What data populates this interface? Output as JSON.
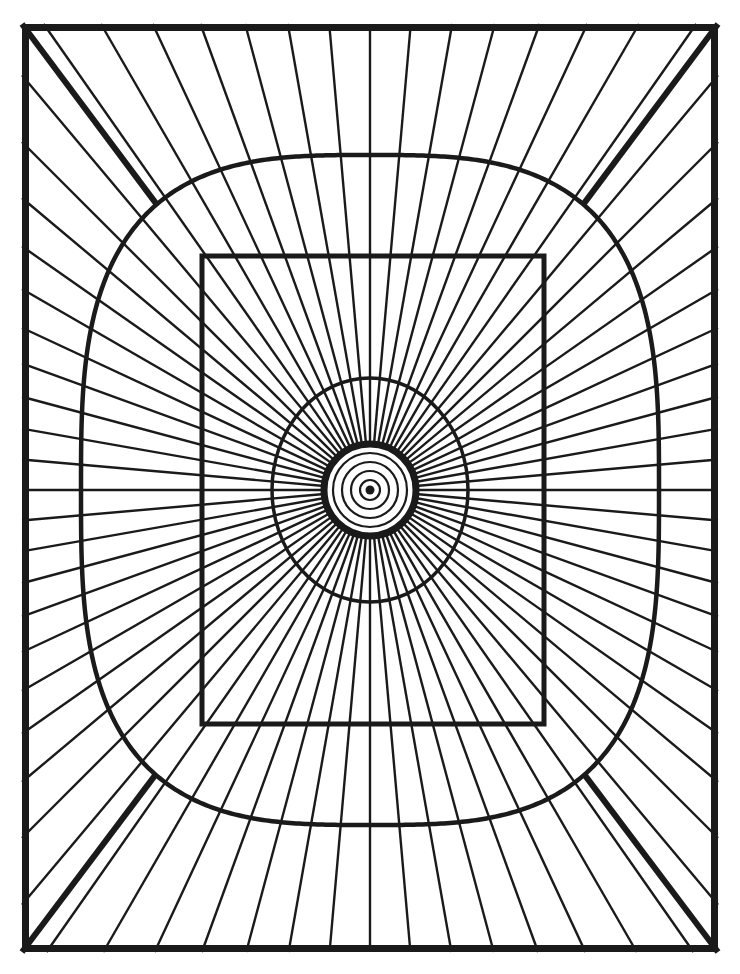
{
  "document": {
    "kind": "line-art-coloring-page",
    "title": "Radial Sunburst Mandala",
    "canvas": {
      "width": 740,
      "height": 974,
      "background": "#ffffff"
    },
    "ink_color": "#1a1a1a"
  },
  "geometry": {
    "center": {
      "x": 370,
      "y": 490
    },
    "outer_frame": {
      "name": "outer-rectangle-frame",
      "x": 22,
      "y": 24,
      "width": 696,
      "height": 928,
      "stroke_width": 7
    },
    "corner_diagonals": {
      "name": "corner-diagonal-rays",
      "count": 4,
      "stroke_width": 6,
      "from_corners": [
        {
          "x": 22,
          "y": 24
        },
        {
          "x": 718,
          "y": 24
        },
        {
          "x": 718,
          "y": 952
        },
        {
          "x": 22,
          "y": 952
        }
      ],
      "to_points": [
        {
          "x": 165,
          "y": 198
        },
        {
          "x": 575,
          "y": 198
        },
        {
          "x": 575,
          "y": 782
        },
        {
          "x": 165,
          "y": 782
        }
      ]
    },
    "superellipse": {
      "name": "large-squircle-ring",
      "cx": 370,
      "cy": 490,
      "rx": 289,
      "ry": 335,
      "exponent": 3.1,
      "stroke_width": 4.5
    },
    "inner_rectangle": {
      "name": "inner-rectangle-ring",
      "x": 202,
      "y": 256,
      "width": 342,
      "height": 468,
      "stroke_width": 5
    },
    "mid_ellipse": {
      "name": "mid-ellipse-ring",
      "cx": 370,
      "cy": 490,
      "rx": 98,
      "ry": 112,
      "stroke_width": 3.5
    },
    "thick_circle": {
      "name": "thick-core-circle",
      "cx": 370,
      "cy": 490,
      "r": 46,
      "stroke_width": 7
    },
    "concentric_rings": {
      "name": "concentric-core-rings",
      "count": 4,
      "radii": [
        37,
        28,
        19,
        10
      ],
      "stroke_width": 2.2
    },
    "center_dot": {
      "name": "center-dot",
      "cx": 370,
      "cy": 490,
      "r": 4.5
    },
    "spokes": {
      "name": "radial-spokes",
      "count": 72,
      "inner_radius": 46,
      "stroke_width": 2.4,
      "angle_step_degrees": 5
    }
  },
  "chart_data": {
    "type": "scatter",
    "xlabel": "",
    "ylabel": "",
    "series": [
      {
        "name": "concentric-ring-radii",
        "values": [
          4.5,
          10,
          19,
          28,
          37,
          46,
          98,
          112
        ]
      },
      {
        "name": "spoke-angles-degrees",
        "values": [
          0,
          5,
          10,
          15,
          20,
          25,
          30,
          35,
          40,
          45,
          50,
          55,
          60,
          65,
          70,
          75,
          80,
          85,
          90,
          95,
          100,
          105,
          110,
          115,
          120,
          125,
          130,
          135,
          140,
          145,
          150,
          155,
          160,
          165,
          170,
          175,
          180,
          185,
          190,
          195,
          200,
          205,
          210,
          215,
          220,
          225,
          230,
          235,
          240,
          245,
          250,
          255,
          260,
          265,
          270,
          275,
          280,
          285,
          290,
          295,
          300,
          305,
          310,
          315,
          320,
          325,
          330,
          335,
          340,
          345,
          350,
          355
        ]
      }
    ]
  }
}
